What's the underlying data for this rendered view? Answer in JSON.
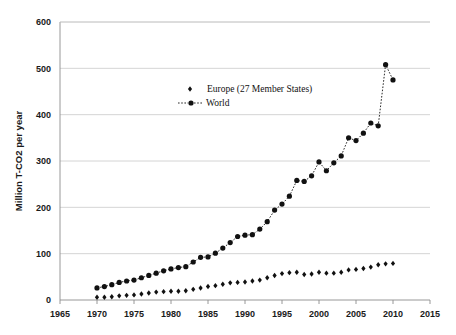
{
  "chart_data": {
    "type": "line",
    "title": "",
    "subtitle": "",
    "xlabel": "",
    "ylabel": "Million T-CO2  per year",
    "xlim": [
      1965,
      2015
    ],
    "ylim": [
      0,
      600
    ],
    "xticks": [
      1965,
      1970,
      1975,
      1980,
      1985,
      1990,
      1995,
      2000,
      2005,
      2010,
      2015
    ],
    "yticks": [
      0,
      100,
      200,
      300,
      400,
      500,
      600
    ],
    "grid": "horizontal",
    "legend_position": "upper-left-inside",
    "x": [
      1970,
      1971,
      1972,
      1973,
      1974,
      1975,
      1976,
      1977,
      1978,
      1979,
      1980,
      1981,
      1982,
      1983,
      1984,
      1985,
      1986,
      1987,
      1988,
      1989,
      1990,
      1991,
      1992,
      1993,
      1994,
      1995,
      1996,
      1997,
      1998,
      1999,
      2000,
      2001,
      2002,
      2003,
      2004,
      2005,
      2006,
      2007,
      2008,
      2009,
      2010
    ],
    "series": [
      {
        "name": "Europe (27 Member States)",
        "marker": "diamond",
        "line": "none",
        "color": "#111111",
        "values": [
          6,
          6,
          7,
          9,
          10,
          11,
          13,
          15,
          17,
          18,
          19,
          19,
          20,
          23,
          26,
          29,
          31,
          34,
          37,
          38,
          39,
          41,
          43,
          48,
          53,
          57,
          59,
          60,
          55,
          56,
          60,
          58,
          58,
          60,
          65,
          66,
          68,
          71,
          76,
          78,
          79
        ]
      },
      {
        "name": "World",
        "marker": "circle",
        "line": "dotted",
        "color": "#111111",
        "values": [
          26,
          29,
          33,
          38,
          41,
          43,
          48,
          53,
          58,
          63,
          67,
          70,
          72,
          82,
          92,
          93,
          101,
          112,
          124,
          137,
          140,
          141,
          153,
          169,
          194,
          207,
          224,
          258,
          256,
          268,
          298,
          279,
          296,
          311,
          350,
          344,
          360,
          382,
          376,
          508,
          475
        ]
      }
    ],
    "legend": [
      {
        "label": "Europe (27 Member States)",
        "marker": "diamond",
        "line": "none"
      },
      {
        "label": "World",
        "marker": "circle",
        "line": "dotted"
      }
    ]
  },
  "colors": {
    "background": "#ffffff",
    "grid": "#c9c9c9",
    "axis": "#8c8c8c",
    "data": "#111111",
    "text": "#1a1a1a"
  }
}
